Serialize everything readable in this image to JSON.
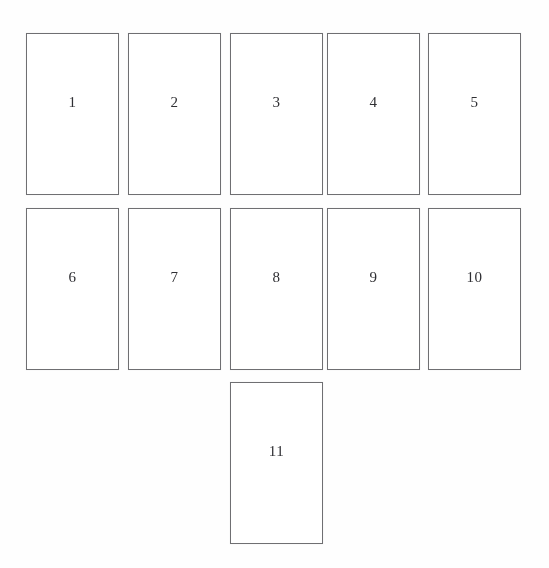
{
  "figure": {
    "type": "panel-grid-diagram",
    "background_color": "#fefefe",
    "border_color": "#6f6f72",
    "label_color": "#2f2f33",
    "panel_width": 93,
    "panel_height": 162,
    "rows": [
      {
        "row_index": 1,
        "top": 33,
        "panels": [
          {
            "label": "1",
            "left": 26
          },
          {
            "label": "2",
            "left": 128
          },
          {
            "label": "3",
            "left": 230
          },
          {
            "label": "4",
            "left": 327
          },
          {
            "label": "5",
            "left": 428
          }
        ]
      },
      {
        "row_index": 2,
        "top": 208,
        "panels": [
          {
            "label": "6",
            "left": 26
          },
          {
            "label": "7",
            "left": 128
          },
          {
            "label": "8",
            "left": 230
          },
          {
            "label": "9",
            "left": 327
          },
          {
            "label": "10",
            "left": 428
          }
        ]
      },
      {
        "row_index": 3,
        "top": 382,
        "panels": [
          {
            "label": "11",
            "left": 230
          }
        ]
      }
    ]
  }
}
